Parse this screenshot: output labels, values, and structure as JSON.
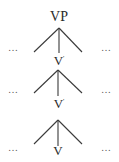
{
  "diagram": {
    "type": "syntax-tree",
    "root": {
      "label": "VP"
    },
    "levels": [
      {
        "label": "V",
        "prime": "'",
        "left_sibling": "…",
        "right_sibling": "…"
      },
      {
        "label": "V",
        "prime": "'",
        "left_sibling": "…",
        "right_sibling": "…"
      },
      {
        "label": "V",
        "prime": "",
        "left_sibling": "…",
        "right_sibling": "…"
      }
    ],
    "colors": {
      "line": "#3a3a3a",
      "text": "#2a2a2a",
      "background": "#ffffff"
    }
  }
}
